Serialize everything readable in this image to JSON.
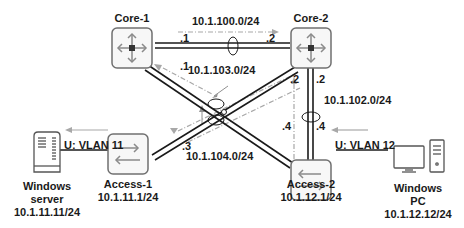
{
  "colors": {
    "link": "#1a1a1a",
    "device_border": "#707070",
    "device_fill": "#f7f7f7",
    "icon": "#8a8a8a",
    "flow_arrow": "#a0a0a0",
    "text": "#1a1a1a"
  },
  "devices": {
    "core1": {
      "name": "Core-1",
      "icon": "core-switch-icon"
    },
    "core2": {
      "name": "Core-2",
      "icon": "core-switch-icon"
    },
    "access1": {
      "name": "Access-1",
      "ip": "10.1.11.1/24",
      "icon": "access-switch-icon"
    },
    "access2": {
      "name": "Access-2",
      "ip": "10.1.12.1/24",
      "icon": "access-switch-icon"
    },
    "server": {
      "name_line1": "Windows",
      "name_line2": "server",
      "ip": "10.1.11.11/24",
      "icon": "server-icon"
    },
    "pc": {
      "name_line1": "Windows",
      "name_line2": "PC",
      "ip": "10.1.12.12/24",
      "icon": "desktop-pc-icon"
    }
  },
  "links": {
    "core1_core2": {
      "subnet": "10.1.100.0/24",
      "core1_host": ".1",
      "core2_host": ".2"
    },
    "core1_access2": {
      "subnet": "10.1.103.0/24",
      "core1_host": ".1",
      "access2_host": ".4"
    },
    "core2_access2": {
      "subnet": "10.1.102.0/24",
      "core2_host": ".2",
      "access2_host": ".4"
    },
    "core2_access1": {
      "subnet": "10.1.104.0/24",
      "core2_host": ".2",
      "access1_host": ".3"
    },
    "server_access1": {
      "label": "U: VLAN 11"
    },
    "pc_access2": {
      "label": "U: VLAN 12"
    }
  }
}
